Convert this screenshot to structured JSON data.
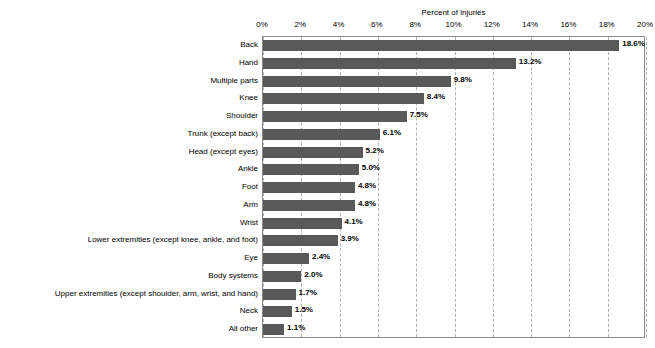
{
  "clipped_caption": "",
  "chart_data": {
    "type": "bar",
    "orientation": "horizontal",
    "title": "",
    "xlabel": "Percent of injuries",
    "ylabel": "",
    "xlim": [
      0,
      20
    ],
    "xtick_labels": [
      "0%",
      "2%",
      "4%",
      "6%",
      "8%",
      "10%",
      "12%",
      "14%",
      "16%",
      "18%",
      "20%"
    ],
    "xtick_values": [
      0,
      2,
      4,
      6,
      8,
      10,
      12,
      14,
      16,
      18,
      20
    ],
    "grid": "vertical-dashed",
    "legend": "none",
    "bar_color": "#595959",
    "categories": [
      "Back",
      "Hand",
      "Multiple parts",
      "Knee",
      "Shoulder",
      "Trunk (except back)",
      "Head (except eyes)",
      "Ankle",
      "Foot",
      "Arm",
      "Wrist",
      "Lower extremities (except knee, ankle, and foot)",
      "Eye",
      "Body systems",
      "Upper extremities (except shoulder, arm, wrist, and hand)",
      "Neck",
      "All other"
    ],
    "values": [
      18.6,
      13.2,
      9.8,
      8.4,
      7.5,
      6.1,
      5.2,
      5.0,
      4.8,
      4.8,
      4.1,
      3.9,
      2.4,
      2.0,
      1.7,
      1.5,
      1.1
    ],
    "value_labels": [
      "18.6%",
      "13.2%",
      "9.8%",
      "8.4%",
      "7.5%",
      "6.1%",
      "5.2%",
      "5.0%",
      "4.8%",
      "4.8%",
      "4.1%",
      "3.9%",
      "2.4%",
      "2.0%",
      "1.7%",
      "1.5%",
      "1.1%"
    ]
  }
}
